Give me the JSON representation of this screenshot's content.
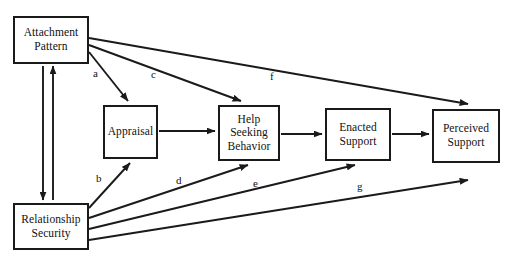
{
  "figure": {
    "type": "path-diagram",
    "background_color": "#ffffff",
    "line_color": "#1a1a1a",
    "text_color": "#111111",
    "width": 511,
    "height": 263
  },
  "nodes": [
    {
      "id": "attachment-pattern",
      "label": "Attachment\nPattern",
      "x": 13,
      "y": 16,
      "w": 76,
      "h": 48
    },
    {
      "id": "relationship-security",
      "label": "Relationship\nSecurity",
      "x": 13,
      "y": 203,
      "w": 76,
      "h": 47
    },
    {
      "id": "appraisal",
      "label": "Appraisal",
      "x": 103,
      "y": 105,
      "w": 55,
      "h": 54
    },
    {
      "id": "help-seeking-behavior",
      "label": "Help\nSeeking\nBehavior",
      "x": 218,
      "y": 105,
      "w": 62,
      "h": 56
    },
    {
      "id": "enacted-support",
      "label": "Enacted\nSupport",
      "x": 325,
      "y": 108,
      "w": 66,
      "h": 53
    },
    {
      "id": "perceived-support",
      "label": "Perceived\nSupport",
      "x": 432,
      "y": 109,
      "w": 68,
      "h": 54
    }
  ],
  "path_labels": [
    {
      "id": "a",
      "text": "a",
      "x": 93,
      "y": 68
    },
    {
      "id": "c",
      "text": "c",
      "x": 151,
      "y": 69
    },
    {
      "id": "f",
      "text": "f",
      "x": 270,
      "y": 71
    },
    {
      "id": "b",
      "text": "b",
      "x": 96,
      "y": 173
    },
    {
      "id": "d",
      "text": "d",
      "x": 176,
      "y": 175
    },
    {
      "id": "e",
      "text": "e",
      "x": 253,
      "y": 178
    },
    {
      "id": "g",
      "text": "g",
      "x": 357,
      "y": 181
    }
  ],
  "edges": [
    {
      "id": "attachment-to-appraisal",
      "label": "a",
      "from": "attachment-pattern",
      "to": "appraisal",
      "x1": 89,
      "y1": 52,
      "x2": 128,
      "y2": 101,
      "arrow": "end"
    },
    {
      "id": "attachment-to-help-seeking",
      "label": "c",
      "from": "attachment-pattern",
      "to": "help-seeking-behavior",
      "x1": 89,
      "y1": 45,
      "x2": 241,
      "y2": 101,
      "arrow": "end"
    },
    {
      "id": "attachment-to-perceived-support",
      "label": "f",
      "from": "attachment-pattern",
      "to": "perceived-support",
      "x1": 89,
      "y1": 38,
      "x2": 468,
      "y2": 104,
      "arrow": "end"
    },
    {
      "id": "security-to-appraisal",
      "label": "b",
      "from": "relationship-security",
      "to": "appraisal",
      "x1": 89,
      "y1": 208,
      "x2": 130,
      "y2": 163,
      "arrow": "end"
    },
    {
      "id": "security-to-help-seeking",
      "label": "d",
      "from": "relationship-security",
      "to": "help-seeking-behavior",
      "x1": 89,
      "y1": 218,
      "x2": 248,
      "y2": 165,
      "arrow": "end"
    },
    {
      "id": "security-to-enacted-support",
      "label": "e",
      "from": "relationship-security",
      "to": "enacted-support",
      "x1": 89,
      "y1": 229,
      "x2": 355,
      "y2": 165,
      "arrow": "end"
    },
    {
      "id": "security-to-perceived-support",
      "label": "g",
      "from": "relationship-security",
      "to": "perceived-support",
      "x1": 89,
      "y1": 240,
      "x2": 468,
      "y2": 180,
      "arrow": "end"
    },
    {
      "id": "appraisal-to-help-seeking",
      "label": "",
      "from": "appraisal",
      "to": "help-seeking-behavior",
      "x1": 159,
      "y1": 131,
      "x2": 215,
      "y2": 131,
      "arrow": "end"
    },
    {
      "id": "help-seeking-to-enacted",
      "label": "",
      "from": "help-seeking-behavior",
      "to": "enacted-support",
      "x1": 281,
      "y1": 134,
      "x2": 322,
      "y2": 134,
      "arrow": "end"
    },
    {
      "id": "enacted-to-perceived",
      "label": "",
      "from": "enacted-support",
      "to": "perceived-support",
      "x1": 392,
      "y1": 134,
      "x2": 429,
      "y2": 134,
      "arrow": "end"
    },
    {
      "id": "attachment-down-to-security",
      "label": "",
      "from": "attachment-pattern",
      "to": "relationship-security",
      "x1": 43,
      "y1": 66,
      "x2": 43,
      "y2": 200,
      "arrow": "end"
    },
    {
      "id": "security-up-to-attachment",
      "label": "",
      "from": "relationship-security",
      "to": "attachment-pattern",
      "x1": 53,
      "y1": 200,
      "x2": 53,
      "y2": 66,
      "arrow": "end"
    }
  ]
}
